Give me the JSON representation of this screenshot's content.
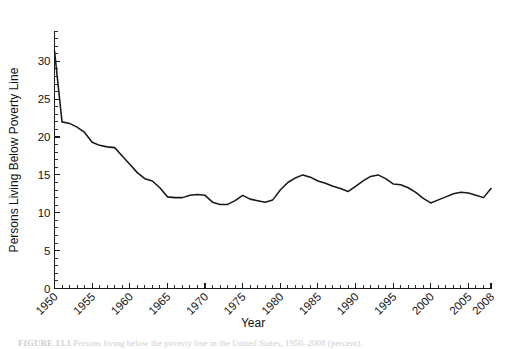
{
  "figure": {
    "caption_label": "FIGURE 13.1",
    "caption_text": "Persons living below the poverty line in the United States, 1950–2008 (percent)."
  },
  "axes": {
    "x_title": "Year",
    "y_title": "Persons Living Below Poverty Line",
    "x_ticks": [
      "1950",
      "1955",
      "1960",
      "1965",
      "1970",
      "1975",
      "1980",
      "1985",
      "1990",
      "1995",
      "2000",
      "2005",
      "2008"
    ],
    "y_ticks": [
      "0",
      "5",
      "10",
      "15",
      "20",
      "25",
      "30"
    ]
  },
  "chart_data": {
    "type": "line",
    "title": "",
    "subtitle": "",
    "xlabel": "Year",
    "ylabel": "Persons Living Below Poverty Line",
    "xlim": [
      1950,
      2008
    ],
    "ylim": [
      0,
      34
    ],
    "grid": false,
    "legend": "none",
    "line_color": "#18181a",
    "x_tick_labels": [
      "1950",
      "1955",
      "1960",
      "1965",
      "1970",
      "1975",
      "1980",
      "1985",
      "1990",
      "1995",
      "2000",
      "2005",
      "2008"
    ],
    "x_tick_values": [
      1950,
      1955,
      1960,
      1965,
      1970,
      1975,
      1980,
      1985,
      1990,
      1995,
      2000,
      2005,
      2008
    ],
    "y_tick_values": [
      0,
      5,
      10,
      15,
      20,
      25,
      30
    ],
    "x_minor_tick_step": 1,
    "y_minor_tick_step": 1,
    "series": [
      {
        "name": "Persons Living Below Poverty Line",
        "x": [
          1950,
          1951,
          1952,
          1953,
          1954,
          1955,
          1956,
          1957,
          1958,
          1959,
          1960,
          1961,
          1962,
          1963,
          1964,
          1965,
          1966,
          1967,
          1968,
          1969,
          1970,
          1971,
          1972,
          1973,
          1974,
          1975,
          1976,
          1977,
          1978,
          1979,
          1980,
          1981,
          1982,
          1983,
          1984,
          1985,
          1986,
          1987,
          1988,
          1989,
          1990,
          1991,
          1992,
          1993,
          1994,
          1995,
          1996,
          1997,
          1998,
          1999,
          2000,
          2001,
          2002,
          2003,
          2004,
          2005,
          2006,
          2007,
          2008
        ],
        "values": [
          31.4,
          22.0,
          21.8,
          21.3,
          20.6,
          19.3,
          18.9,
          18.7,
          18.6,
          17.5,
          16.4,
          15.3,
          14.5,
          14.2,
          13.3,
          12.1,
          12.0,
          12.0,
          12.3,
          12.4,
          12.3,
          11.4,
          11.1,
          11.1,
          11.6,
          12.3,
          11.8,
          11.6,
          11.4,
          11.7,
          13.0,
          14.0,
          14.6,
          15.0,
          14.7,
          14.2,
          13.9,
          13.5,
          13.2,
          12.8,
          13.5,
          14.2,
          14.8,
          15.0,
          14.5,
          13.8,
          13.7,
          13.3,
          12.7,
          11.9,
          11.3,
          11.7,
          12.1,
          12.5,
          12.7,
          12.6,
          12.3,
          12.0,
          13.2
        ]
      }
    ]
  }
}
